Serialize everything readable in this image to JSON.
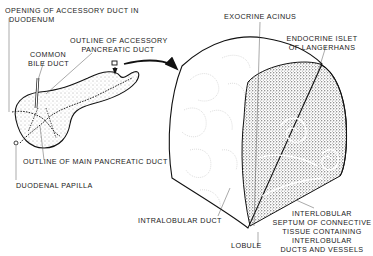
{
  "diagram": {
    "left_figure": {
      "name": "Pancreas (external view with duct outlines)",
      "labels": {
        "opening_accessory": "OPENING OF ACCESSORY DUCT IN",
        "opening_accessory_2": "DUODENUM",
        "common_bile_1": "COMMON",
        "common_bile_2": "BILE DUCT",
        "outline_accessory_1": "OUTLINE OF ACCESSORY",
        "outline_accessory_2": "PANCREATIC DUCT",
        "outline_main": "OUTLINE OF MAIN PANCREATIC DUCT",
        "duodenal_papilla": "DUODENAL PAPILLA"
      }
    },
    "arrow": {
      "from": "small tissue block on pancreas",
      "to": "magnified block"
    },
    "right_figure": {
      "name": "Magnified pancreatic tissue block",
      "labels": {
        "exocrine_acinus": "EXOCRINE ACINUS",
        "islet_1": "ENDOCRINE ISLET",
        "islet_2": "OF LANGERHANS",
        "intralobular_duct": "INTRALOBULAR DUCT",
        "lobule": "LOBULE",
        "septum_1": "INTERLOBULAR",
        "septum_2": "SEPTUM OF CONNECTIVE",
        "septum_3": "TISSUE CONTAINING",
        "septum_4": "INTERLOBULAR",
        "septum_5": "DUCTS AND VESSELS"
      }
    },
    "colors": {
      "ink": "#222222",
      "background": "#ffffff",
      "faint": "#bbbbbb"
    }
  }
}
